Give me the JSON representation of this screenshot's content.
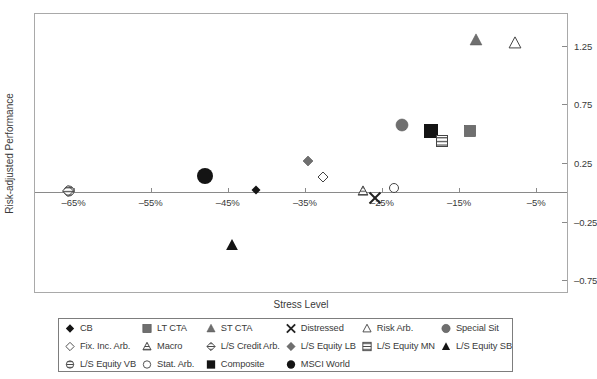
{
  "chart_data": {
    "type": "scatter",
    "title": "",
    "xlabel": "Stress Level",
    "ylabel": "Risk-adjusted Performance",
    "xlim": [
      -70,
      -1
    ],
    "ylim": [
      -0.85,
      1.52
    ],
    "xticks": [
      -65,
      -55,
      -45,
      -35,
      -25,
      -15,
      -5
    ],
    "xtick_labels": [
      "–65%",
      "–55%",
      "–45%",
      "–35%",
      "–25%",
      "–15%",
      "–5%"
    ],
    "yticks": [
      1.25,
      0.75,
      0.25,
      -0.25,
      -0.75
    ],
    "ytick_labels": [
      "1.25",
      "0.75",
      "0.25",
      "–0.25",
      "–0.75"
    ],
    "grid": false,
    "legend_position": "below-plot",
    "points": [
      {
        "label": "CB",
        "marker": "filled-diamond",
        "x": -41.3,
        "y": 0.02,
        "size": 9,
        "color": "#111111"
      },
      {
        "label": "Fix. Inc. Arb.",
        "marker": "open-diamond",
        "x": -32.6,
        "y": 0.13,
        "size": 10,
        "color": "#ffffff"
      },
      {
        "label": "L/S Equity VB",
        "marker": "striped-circle",
        "x": -65.6,
        "y": 0.01,
        "size": 11,
        "color": "#ffffff"
      },
      {
        "label": "LT CTA",
        "marker": "gray-square",
        "x": -13.6,
        "y": 0.52,
        "size": 11,
        "color": "#7a7a7a"
      },
      {
        "label": "Macro",
        "marker": "striped-triangle",
        "x": -27.4,
        "y": 0.01,
        "size": 10,
        "color": "#ffffff"
      },
      {
        "label": "Stat. Arb.",
        "marker": "open-circle",
        "x": -23.5,
        "y": 0.04,
        "size": 10,
        "color": "#ffffff"
      },
      {
        "label": "ST CTA",
        "marker": "gray-triangle",
        "x": -12.8,
        "y": 1.3,
        "size": 12,
        "color": "#6f6f6f"
      },
      {
        "label": "L/S Credit Arb.",
        "marker": "striped-diamond",
        "x": -65.7,
        "y": 0.01,
        "size": 11,
        "color": "#ffffff"
      },
      {
        "label": "Composite",
        "marker": "filled-square",
        "x": -18.7,
        "y": 0.52,
        "size": 14,
        "color": "#111111"
      },
      {
        "label": "Distressed",
        "marker": "x-cross",
        "x": -25.9,
        "y": -0.05,
        "size": 11,
        "color": "#222222"
      },
      {
        "label": "L/S Equity LB",
        "marker": "gray-diamond",
        "x": -34.6,
        "y": 0.27,
        "size": 10,
        "color": "#777777"
      },
      {
        "label": "MSCI World",
        "marker": "filled-circle",
        "x": -48.0,
        "y": 0.14,
        "size": 16,
        "color": "#0a0a0a"
      },
      {
        "label": "Risk Arb.",
        "marker": "open-triangle",
        "x": -7.7,
        "y": 1.27,
        "size": 12,
        "color": "#ffffff"
      },
      {
        "label": "L/S Equity MN",
        "marker": "striped-square",
        "x": -17.2,
        "y": 0.44,
        "size": 11,
        "color": "#ffffff"
      },
      {
        "label": "L/S Equity SB",
        "marker": "filled-triangle",
        "x": -44.5,
        "y": -0.45,
        "size": 12,
        "color": "#111111"
      },
      {
        "label": "Special Sit",
        "marker": "gray-circle",
        "x": -22.4,
        "y": 0.57,
        "size": 12,
        "color": "#6f6f6f"
      }
    ]
  },
  "axes": {
    "y_title": "Risk-adjusted Performance",
    "x_title": "Stress Level"
  },
  "legend": {
    "items": [
      {
        "label": "CB",
        "marker": "filled-diamond"
      },
      {
        "label": "LT CTA",
        "marker": "gray-square"
      },
      {
        "label": "ST CTA",
        "marker": "gray-triangle"
      },
      {
        "label": "Distressed",
        "marker": "x-cross"
      },
      {
        "label": "Risk Arb.",
        "marker": "open-triangle"
      },
      {
        "label": "Special Sit",
        "marker": "gray-circle"
      },
      {
        "label": "Fix. Inc. Arb.",
        "marker": "open-diamond"
      },
      {
        "label": "Macro",
        "marker": "striped-triangle"
      },
      {
        "label": "L/S Credit Arb.",
        "marker": "striped-diamond"
      },
      {
        "label": "L/S Equity LB",
        "marker": "gray-diamond"
      },
      {
        "label": "L/S Equity MN",
        "marker": "striped-square"
      },
      {
        "label": "L/S Equity SB",
        "marker": "filled-triangle"
      },
      {
        "label": "L/S Equity VB",
        "marker": "striped-circle"
      },
      {
        "label": "Stat. Arb.",
        "marker": "open-circle"
      },
      {
        "label": "Composite",
        "marker": "filled-square"
      },
      {
        "label": "MSCI World",
        "marker": "filled-circle"
      }
    ]
  },
  "colors": {
    "frame": "#a9a9a9",
    "axis": "#8a8a8a",
    "text": "#3a3a3a",
    "gray_fill": "#6f6f6f",
    "black_fill": "#111111"
  }
}
